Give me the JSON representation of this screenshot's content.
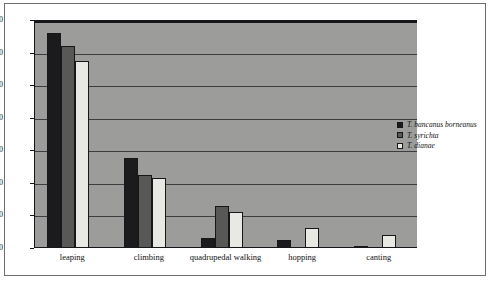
{
  "chart_data": {
    "type": "bar",
    "title": "",
    "xlabel": "",
    "ylabel": "",
    "ylim": [
      0,
      70
    ],
    "yticks": [
      0,
      10,
      20,
      30,
      40,
      50,
      60,
      70
    ],
    "grid": true,
    "legend_position": "right",
    "categories": [
      "leaping",
      "climbing",
      "quadrupedal walking",
      "hopping",
      "canting"
    ],
    "series": [
      {
        "name": "T. bancanus borneanus",
        "color": "#1b1b1d",
        "values": [
          66,
          27.5,
          3,
          2.5,
          0.7
        ]
      },
      {
        "name": "T. syrichta",
        "color": "#585857",
        "values": [
          62,
          22.5,
          13,
          0,
          0
        ]
      },
      {
        "name": "T. dianae",
        "color": "#e9e9e4",
        "values": [
          57.5,
          21.5,
          11,
          6,
          4
        ]
      }
    ]
  },
  "legend": {
    "items": [
      {
        "label": "T. bancanus borneanus",
        "swatch": "#1b1b1d"
      },
      {
        "label": "T. syrichta",
        "swatch": "#585857"
      },
      {
        "label": "T. dianae",
        "swatch": "#e9e9e4"
      }
    ]
  },
  "axis": {
    "y_tick_labels": [
      "0",
      "10",
      "20",
      "30",
      "40",
      "50",
      "60",
      "70"
    ],
    "x_tick_labels": [
      "leaping",
      "climbing",
      "quadrupedal walking",
      "hopping",
      "canting"
    ]
  },
  "colors": {
    "plot_background": "#9c9c9a",
    "gridline": "#3d3d40",
    "axis": "#16161a",
    "frame": "#6e6e6e",
    "page_background": "#ffffff"
  }
}
